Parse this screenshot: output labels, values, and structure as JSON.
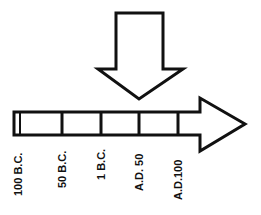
{
  "diagram": {
    "type": "timeline",
    "colors": {
      "stroke": "#111111",
      "fill": "#ffffff"
    },
    "pointer_arrow": {
      "direction": "down",
      "points_to": "A.D. 50 region"
    },
    "timeline_arrow": {
      "direction": "right"
    },
    "labels": [
      {
        "text": "100 B.C."
      },
      {
        "text": "50 B.C."
      },
      {
        "text": "1 B.C."
      },
      {
        "text": "A.D. 50"
      },
      {
        "text": "A.D.100"
      }
    ]
  }
}
